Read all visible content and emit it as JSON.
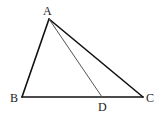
{
  "figure": {
    "type": "triangle",
    "vertices": [
      "A",
      "B",
      "C"
    ],
    "point_on_side": {
      "name": "D",
      "side": "BC"
    },
    "segments": [
      "AB",
      "BC",
      "CA",
      "AD"
    ],
    "labels": {
      "A": "A",
      "B": "B",
      "C": "C",
      "D": "D"
    },
    "colors": {
      "edge": "#111111",
      "cevian": "#555555"
    }
  }
}
